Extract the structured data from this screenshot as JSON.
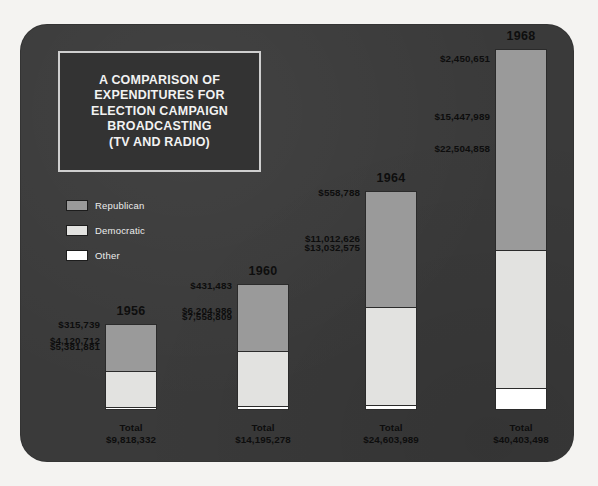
{
  "poster": {
    "background_color": "#f4f3f1",
    "panel_color": "#3a3a3a",
    "title": "A COMPARISON OF\nEXPENDITURES FOR\nELECTION CAMPAIGN\nBROADCASTING\n(TV AND RADIO)"
  },
  "legend": {
    "items": [
      {
        "label": "Republican",
        "color": "#9a9a9a",
        "key": "republican"
      },
      {
        "label": "Democratic",
        "color": "#e2e2e0",
        "key": "democratic"
      },
      {
        "label": "Other",
        "color": "#ffffff",
        "key": "other"
      }
    ]
  },
  "total_prefix": "Total",
  "chart_data": {
    "type": "bar",
    "subtype": "stacked",
    "title": "A COMPARISON OF EXPENDITURES FOR ELECTION CAMPAIGN BROADCASTING (TV AND RADIO)",
    "xlabel": "",
    "ylabel": "",
    "grid": false,
    "legend_position": "upper-left",
    "axis_visible": false,
    "value_unit": "US dollars",
    "ylim": [
      0,
      40403498
    ],
    "categories": [
      "1956",
      "1960",
      "1964",
      "1968"
    ],
    "series": [
      {
        "name": "Republican",
        "color": "#9a9a9a",
        "values": [
          5381881,
          7558809,
          13032575,
          22504858
        ],
        "labels": [
          "$5,381,881",
          "$7,558,809",
          "$13,032,575",
          "$22,504,858"
        ]
      },
      {
        "name": "Democratic",
        "color": "#e2e2e0",
        "values": [
          4120712,
          6204986,
          11012626,
          15447989
        ],
        "labels": [
          "$4,120,712",
          "$6,204,986",
          "$11,012,626",
          "$15,447,989"
        ]
      },
      {
        "name": "Other",
        "color": "#ffffff",
        "values": [
          315739,
          431483,
          558788,
          2450651
        ],
        "labels": [
          "$315,739",
          "$431,483",
          "$558,788",
          "$2,450,651"
        ]
      }
    ],
    "totals": [
      9818332,
      14195278,
      24603989,
      40403498
    ],
    "total_labels": [
      "$9,818,332",
      "$14,195,278",
      "$24,603,989",
      "$40,403,498"
    ]
  },
  "groups": [
    {
      "year": "1956",
      "total_label": "$9,818,332",
      "segments": [
        {
          "name": "Republican",
          "label": "$5,381,881"
        },
        {
          "name": "Democratic",
          "label": "$4,120,712"
        },
        {
          "name": "Other",
          "label": "$315,739"
        }
      ]
    },
    {
      "year": "1960",
      "total_label": "$14,195,278",
      "segments": [
        {
          "name": "Republican",
          "label": "$7,558,809"
        },
        {
          "name": "Democratic",
          "label": "$6,204,986"
        },
        {
          "name": "Other",
          "label": "$431,483"
        }
      ]
    },
    {
      "year": "1964",
      "total_label": "$24,603,989",
      "segments": [
        {
          "name": "Republican",
          "label": "$13,032,575"
        },
        {
          "name": "Democratic",
          "label": "$11,012,626"
        },
        {
          "name": "Other",
          "label": "$558,788"
        }
      ]
    },
    {
      "year": "1968",
      "total_label": "$40,403,498",
      "segments": [
        {
          "name": "Republican",
          "label": "$22,504,858"
        },
        {
          "name": "Democratic",
          "label": "$15,447,989"
        },
        {
          "name": "Other",
          "label": "$2,450,651"
        }
      ]
    }
  ]
}
